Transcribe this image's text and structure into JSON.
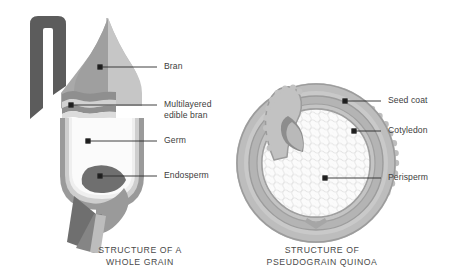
{
  "figure": {
    "title_whole_grain": "STRUCTURE OF A\nWHOLE GRAIN",
    "title_quinoa": "STRUCTURE OF\nPSEUDOGRAIN QUINOA"
  },
  "whole_grain": {
    "caption": "STRUCTURE OF A\nWHOLE GRAIN",
    "labels": [
      {
        "id": "bran",
        "text": "Bran",
        "dot": {
          "x": 100,
          "y": 67
        },
        "line_end": {
          "x": 157,
          "y": 67
        },
        "text_pos": {
          "x": 164,
          "y": 62
        }
      },
      {
        "id": "multilayered-edible-bran",
        "text": "Multilayered\nedible bran",
        "dot": {
          "x": 71,
          "y": 105
        },
        "line_end": {
          "x": 157,
          "y": 105
        },
        "text_pos": {
          "x": 164,
          "y": 100
        }
      },
      {
        "id": "germ",
        "text": "Germ",
        "dot": {
          "x": 88,
          "y": 141
        },
        "line_end": {
          "x": 157,
          "y": 141
        },
        "text_pos": {
          "x": 164,
          "y": 136
        }
      },
      {
        "id": "endosperm",
        "text": "Endosperm",
        "dot": {
          "x": 100,
          "y": 176
        },
        "line_end": {
          "x": 157,
          "y": 176
        },
        "text_pos": {
          "x": 164,
          "y": 171
        }
      }
    ]
  },
  "quinoa": {
    "caption": "STRUCTURE OF\nPSEUDOGRAIN QUINOA",
    "labels": [
      {
        "id": "seed-coat",
        "text": "Seed coat",
        "dot": {
          "x": 345,
          "y": 101
        },
        "line_end": {
          "x": 381,
          "y": 101
        },
        "text_pos": {
          "x": 388,
          "y": 96
        }
      },
      {
        "id": "cotyledon",
        "text": "Cotyledon",
        "dot": {
          "x": 354,
          "y": 131
        },
        "line_end": {
          "x": 381,
          "y": 131
        },
        "text_pos": {
          "x": 388,
          "y": 126
        }
      },
      {
        "id": "perisperm",
        "text": "Perisperm",
        "dot": {
          "x": 325,
          "y": 178
        },
        "line_end": {
          "x": 381,
          "y": 178
        },
        "text_pos": {
          "x": 388,
          "y": 173
        }
      }
    ]
  },
  "colors": {
    "background": "#ffffff",
    "dark_gray": "#595959",
    "mid_gray": "#8c8c8c",
    "light_gray": "#b5b5b5",
    "pale_gray": "#cfcfcf",
    "very_pale": "#e6e6e6",
    "near_white": "#f4f4f4",
    "text": "#3d3d3d",
    "leader_line": "#2b2b2b"
  }
}
